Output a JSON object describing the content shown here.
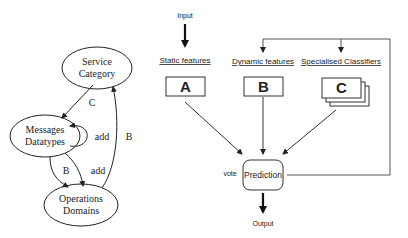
{
  "left_graph": {
    "nodes": [
      {
        "id": "service",
        "line1": "Service",
        "line2": "Category"
      },
      {
        "id": "messages",
        "line1": "Messages",
        "line2": "Datatypes"
      },
      {
        "id": "operations",
        "line1": "Operations",
        "line2": "Domains"
      }
    ],
    "edges": [
      {
        "from": "service",
        "to": "messages",
        "label": "C"
      },
      {
        "from": "messages",
        "to": "messages",
        "label": "add"
      },
      {
        "from": "messages",
        "to": "operations",
        "label": "B"
      },
      {
        "from": "messages",
        "to": "operations",
        "label": "add"
      },
      {
        "from": "operations",
        "to": "service",
        "label": "B"
      }
    ]
  },
  "right_diagram": {
    "input_label": "Input",
    "output_label": "Output",
    "vote_label": "vote",
    "prediction_label": "Prediction",
    "columns": [
      {
        "title": "Static features",
        "box": "A"
      },
      {
        "title": "Dynamic features",
        "box": "B"
      },
      {
        "title": "Specialised Classifiers",
        "box": "C"
      }
    ]
  }
}
